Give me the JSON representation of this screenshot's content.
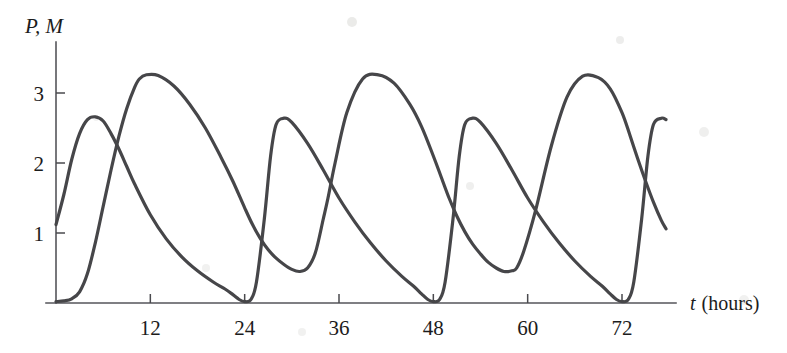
{
  "chart_data": {
    "type": "line",
    "title": "",
    "xlabel": "t (hours)",
    "xlabel_symbol": "t",
    "xlabel_unit": "(hours)",
    "ylabel": "P, M",
    "ylabel_symbols": [
      "P",
      "M"
    ],
    "xlim": [
      0,
      78
    ],
    "ylim": [
      0,
      3.6
    ],
    "xticks": [
      12,
      24,
      36,
      48,
      60,
      72
    ],
    "xtick_labels": [
      "12",
      "24",
      "36",
      "48",
      "60",
      "72"
    ],
    "yticks": [
      1,
      2,
      3
    ],
    "ytick_labels": [
      "1",
      "2",
      "3"
    ],
    "grid": false,
    "legend": "none",
    "period_hours": 24,
    "series": [
      {
        "name": "P",
        "description": "sharp-peaked oscillation, near-zero minima",
        "color": "#464649",
        "x": [
          0,
          1,
          2,
          3,
          4,
          5,
          6,
          7,
          8,
          9,
          10,
          12,
          14,
          16,
          18,
          20,
          21.5,
          22.5,
          23.3,
          24,
          24.8,
          25.5,
          26.5,
          27.3,
          28,
          29,
          30,
          32,
          34,
          36,
          38,
          40,
          42,
          44,
          45.5,
          46.5,
          47.3,
          48,
          48.8,
          49.5,
          50.5,
          51.3,
          52,
          53,
          54,
          56,
          58,
          60,
          62,
          64,
          66,
          68,
          69.5,
          70.5,
          71.3,
          72,
          72.8,
          73.5,
          74.5,
          75.3,
          76,
          77,
          77.6
        ],
        "y": [
          1.12,
          1.55,
          2.05,
          2.42,
          2.62,
          2.66,
          2.6,
          2.42,
          2.2,
          1.95,
          1.7,
          1.26,
          0.92,
          0.66,
          0.46,
          0.3,
          0.2,
          0.12,
          0.05,
          0.02,
          0.05,
          0.3,
          1.2,
          2.1,
          2.55,
          2.64,
          2.58,
          2.28,
          1.9,
          1.5,
          1.16,
          0.86,
          0.6,
          0.38,
          0.24,
          0.13,
          0.05,
          0.02,
          0.05,
          0.3,
          1.2,
          2.1,
          2.55,
          2.64,
          2.58,
          2.28,
          1.9,
          1.5,
          1.16,
          0.86,
          0.6,
          0.38,
          0.24,
          0.13,
          0.05,
          0.02,
          0.05,
          0.3,
          1.2,
          2.1,
          2.55,
          2.64,
          2.62
        ]
      },
      {
        "name": "M",
        "description": "broad rounded oscillation, minima near 0.45",
        "color": "#464649",
        "x": [
          0,
          1,
          2,
          3,
          4,
          5,
          6,
          7,
          8,
          9,
          10,
          10.6,
          11.5,
          13,
          15,
          17,
          19,
          21,
          22.5,
          24,
          25,
          26,
          27,
          28,
          29,
          30,
          31,
          32,
          33,
          34,
          34.6,
          35.5,
          37,
          39,
          41,
          43,
          45,
          46.5,
          48,
          49,
          50,
          51,
          52,
          53,
          54,
          55,
          56,
          57,
          58,
          58.6,
          59.5,
          61,
          63,
          65,
          67,
          69,
          70.5,
          72,
          73,
          74,
          75,
          76,
          77,
          77.6
        ],
        "y": [
          0.02,
          0.03,
          0.06,
          0.16,
          0.42,
          0.86,
          1.38,
          1.9,
          2.38,
          2.78,
          3.08,
          3.2,
          3.26,
          3.25,
          3.1,
          2.84,
          2.5,
          2.08,
          1.74,
          1.36,
          1.12,
          0.92,
          0.76,
          0.64,
          0.55,
          0.48,
          0.45,
          0.5,
          0.72,
          1.2,
          1.5,
          2.0,
          2.72,
          3.2,
          3.26,
          3.14,
          2.84,
          2.52,
          2.1,
          1.8,
          1.5,
          1.24,
          1.02,
          0.84,
          0.7,
          0.58,
          0.5,
          0.45,
          0.46,
          0.5,
          0.74,
          1.32,
          2.24,
          2.94,
          3.24,
          3.22,
          3.06,
          2.72,
          2.4,
          2.06,
          1.74,
          1.44,
          1.18,
          1.06
        ]
      }
    ],
    "annotations": {
      "P_peak_value": 2.66,
      "P_peak_times": [
        5,
        29,
        53,
        77
      ],
      "P_min_value": 0.02,
      "P_min_times": [
        24,
        48,
        72
      ],
      "M_peak_value": 3.26,
      "M_peak_times": [
        12,
        35.5,
        59
      ],
      "M_min_value": 0.45,
      "M_min_times": [
        30.5,
        57
      ]
    }
  },
  "axes": {
    "y_axis_label": "P, M",
    "x_axis_label_symbol": "t",
    "x_axis_label_unit": "(hours)",
    "y_tick_labels": [
      "3",
      "2",
      "1"
    ],
    "x_tick_labels": [
      "12",
      "24",
      "36",
      "48",
      "60",
      "72"
    ]
  },
  "colors": {
    "curve": "#464649",
    "axis": "#55555a",
    "text": "#1c1c1c",
    "background": "#ffffff"
  }
}
